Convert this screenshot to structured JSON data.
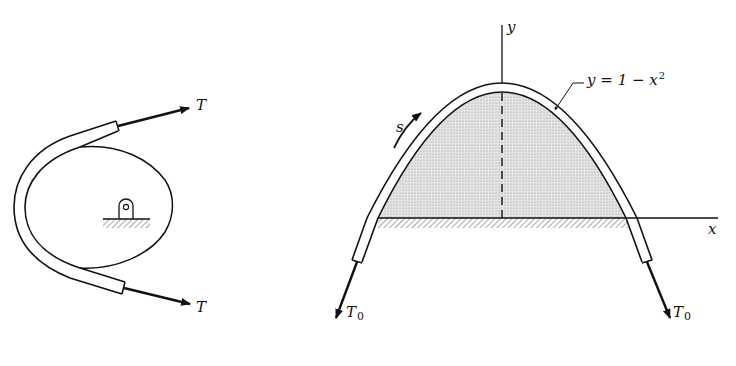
{
  "figures": {
    "left": {
      "description": "Flexible tube wrapped around a cam with pinned support",
      "tension_top_label": "T",
      "tension_bottom_label": "T"
    },
    "right": {
      "description": "Tube draped over parabolic form resting on ground",
      "axis_y_label": "y",
      "axis_x_label": "x",
      "curve_equation": {
        "lhs": "y",
        "eq": "=",
        "rhs_base": "1 − x",
        "rhs_exp": "2"
      },
      "arc_length_label": "s",
      "tension_left_label": "T",
      "tension_left_sub": "0",
      "tension_right_label": "T",
      "tension_right_sub": "0"
    }
  },
  "colors": {
    "ink": "#111111",
    "shade": "#d6d6d6",
    "background": "#ffffff"
  }
}
